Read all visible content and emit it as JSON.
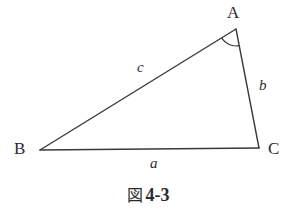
{
  "figure": {
    "domain": "diagram",
    "background_color": "#ffffff",
    "stroke_color": "#3a3a3a",
    "text_color": "#2b2b2b",
    "caption": {
      "kanji": "図",
      "number": "4-3",
      "full": "図 4-3"
    },
    "shape": {
      "type": "triangle",
      "vertices": [
        {
          "name": "A",
          "label": "A",
          "x": 236,
          "y": 29
        },
        {
          "name": "B",
          "label": "B",
          "x": 40,
          "y": 150
        },
        {
          "name": "C",
          "label": "C",
          "x": 259,
          "y": 148
        }
      ],
      "sides": [
        {
          "name": "a",
          "label": "a",
          "from": "B",
          "to": "C",
          "label_x": 155,
          "label_y": 164
        },
        {
          "name": "b",
          "label": "b",
          "from": "A",
          "to": "C",
          "label_x": 264,
          "label_y": 86
        },
        {
          "name": "c",
          "label": "c",
          "from": "A",
          "to": "B",
          "label_x": 142,
          "label_y": 68
        }
      ],
      "angle_marks": [
        {
          "at_vertex": "A",
          "style": "single-arc",
          "radius": 17
        }
      ]
    }
  }
}
